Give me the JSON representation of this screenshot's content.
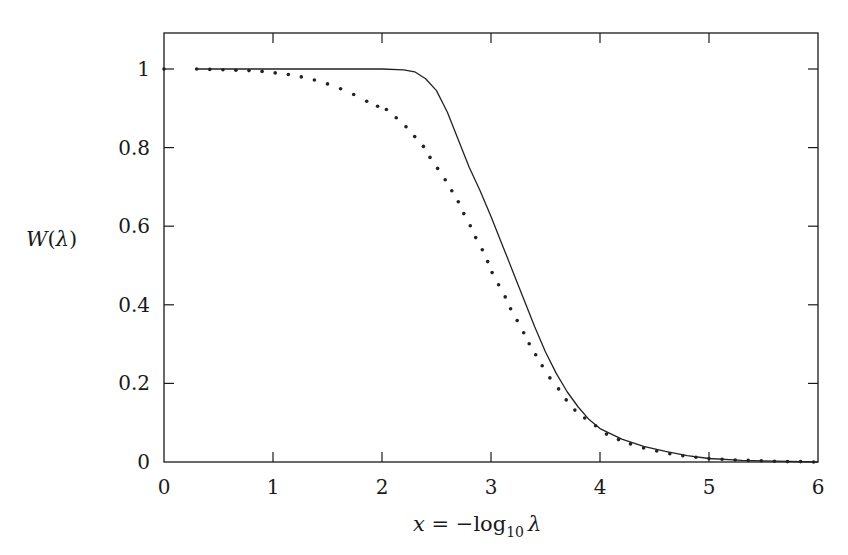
{
  "chart_data": {
    "type": "line",
    "title": "",
    "xlabel": "x = −log10 λ",
    "ylabel": "W(λ)",
    "xlim": [
      0,
      6
    ],
    "ylim": [
      0,
      1.1
    ],
    "grid": false,
    "legend": null,
    "x_ticks": [
      0,
      1,
      2,
      3,
      4,
      5,
      6
    ],
    "x_tick_labels": [
      "0",
      "1",
      "2",
      "3",
      "4",
      "5",
      "6"
    ],
    "y_ticks": [
      0,
      0.2,
      0.4,
      0.6,
      0.8,
      1
    ],
    "y_tick_labels": [
      "0",
      "0.2",
      "0.4",
      "0.6",
      "0.8",
      "1"
    ],
    "series": [
      {
        "name": "solid",
        "style": "solid",
        "x": [
          0.3,
          1.0,
          1.5,
          2.0,
          2.2,
          2.3,
          2.4,
          2.5,
          2.6,
          2.7,
          2.8,
          2.9,
          3.0,
          3.1,
          3.2,
          3.3,
          3.4,
          3.5,
          3.6,
          3.7,
          3.8,
          3.9,
          4.0,
          4.2,
          4.4,
          4.6,
          4.8,
          5.0,
          5.3,
          5.6,
          6.0
        ],
        "y": [
          1.0,
          1.0,
          1.0,
          1.0,
          0.998,
          0.993,
          0.975,
          0.945,
          0.89,
          0.82,
          0.75,
          0.69,
          0.625,
          0.555,
          0.485,
          0.415,
          0.345,
          0.28,
          0.225,
          0.178,
          0.14,
          0.108,
          0.085,
          0.058,
          0.04,
          0.027,
          0.016,
          0.009,
          0.004,
          0.002,
          0.0
        ]
      },
      {
        "name": "dotted",
        "style": "dotted",
        "x": [
          0.0,
          0.3,
          0.42,
          0.54,
          0.66,
          0.78,
          0.9,
          1.02,
          1.14,
          1.26,
          1.38,
          1.5,
          1.62,
          1.74,
          1.86,
          1.96,
          2.04,
          2.13,
          2.22,
          2.3,
          2.38,
          2.44,
          2.51,
          2.58,
          2.64,
          2.7,
          2.75,
          2.81,
          2.86,
          2.92,
          2.97,
          3.01,
          3.07,
          3.13,
          3.18,
          3.24,
          3.3,
          3.35,
          3.41,
          3.47,
          3.54,
          3.62,
          3.69,
          3.77,
          3.86,
          3.96,
          4.06,
          4.17,
          4.28,
          4.4,
          4.52,
          4.64,
          4.76,
          4.88,
          5.0,
          5.12,
          5.24,
          5.36,
          5.48,
          5.6,
          5.72,
          5.84,
          5.96
        ],
        "y": [
          1.0,
          1.0,
          0.999,
          0.998,
          0.997,
          0.996,
          0.994,
          0.99,
          0.986,
          0.98,
          0.972,
          0.962,
          0.95,
          0.935,
          0.918,
          0.905,
          0.897,
          0.876,
          0.853,
          0.828,
          0.803,
          0.775,
          0.747,
          0.718,
          0.69,
          0.662,
          0.632,
          0.601,
          0.571,
          0.54,
          0.51,
          0.482,
          0.451,
          0.42,
          0.39,
          0.36,
          0.329,
          0.301,
          0.273,
          0.245,
          0.214,
          0.186,
          0.158,
          0.132,
          0.112,
          0.092,
          0.071,
          0.057,
          0.046,
          0.036,
          0.028,
          0.021,
          0.016,
          0.012,
          0.009,
          0.007,
          0.005,
          0.004,
          0.003,
          0.002,
          0.001,
          0.001,
          0.0
        ]
      }
    ]
  },
  "axes": {
    "xlabel": {
      "var": "x",
      "eq": " = −",
      "fn": "log",
      "sub": "10",
      "arg": "λ"
    },
    "ylabel": {
      "fn": "W",
      "open": "(",
      "arg": "λ",
      "close": ")"
    }
  },
  "colors": {
    "axis": "#1a1a1a",
    "line": "#222222"
  }
}
